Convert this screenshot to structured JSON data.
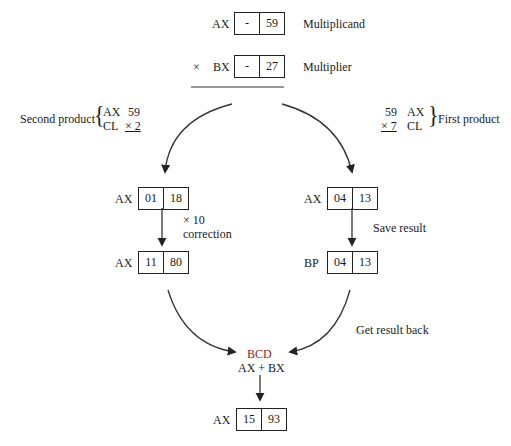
{
  "top": {
    "multiplicand": {
      "reg": "AX",
      "high": "-",
      "low": "59",
      "label": "Multiplicand"
    },
    "multiplier": {
      "op": "×",
      "reg": "BX",
      "high": "-",
      "low": "27",
      "label": "Multiplier"
    }
  },
  "second_product": {
    "label": "Second product",
    "row1_reg": "AX",
    "row1_val": "59",
    "row2_reg": "CL",
    "row2_val": "× 2"
  },
  "first_product": {
    "label": "First product",
    "row1_val": "59",
    "row1_reg": "AX",
    "row2_val": "× 7",
    "row2_reg": "CL"
  },
  "left_branch": {
    "reg1": {
      "reg": "AX",
      "high": "01",
      "low": "18"
    },
    "step_line1": "× 10",
    "step_line2": "correction",
    "reg2": {
      "reg": "AX",
      "high": "11",
      "low": "80"
    }
  },
  "right_branch": {
    "reg1": {
      "reg": "AX",
      "high": "04",
      "low": "13"
    },
    "step": "Save result",
    "reg2": {
      "reg": "BP",
      "high": "04",
      "low": "13"
    },
    "return_step": "Get result back"
  },
  "combine": {
    "line1": "BCD",
    "line2": "AX + BX",
    "result": {
      "reg": "AX",
      "high": "15",
      "low": "93"
    }
  },
  "colors": {
    "ink": "#1a1a1a",
    "bcd": "#8a2a2a"
  }
}
